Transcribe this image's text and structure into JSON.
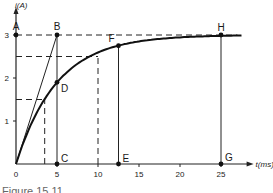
{
  "chart_data": {
    "type": "line",
    "title": "",
    "xlabel": "t(ms)",
    "ylabel": "i(A)",
    "xlim": [
      0,
      28
    ],
    "ylim": [
      0,
      3.4
    ],
    "x_ticks": [
      0,
      5,
      10,
      15,
      20,
      25
    ],
    "y_ticks": [
      1,
      2,
      3
    ],
    "grid": false,
    "series": [
      {
        "name": "current rise",
        "function": "i = 3*(1 - exp(-t/5))",
        "x": [
          0,
          1,
          2,
          3,
          4,
          5,
          6,
          7,
          8,
          10,
          12.5,
          15,
          17.5,
          20,
          22.5,
          25,
          27
        ],
        "y": [
          0,
          0.54,
          0.99,
          1.35,
          1.65,
          1.9,
          2.1,
          2.26,
          2.4,
          2.59,
          2.75,
          2.85,
          2.91,
          2.95,
          2.97,
          2.98,
          2.99
        ]
      }
    ],
    "tangent_line": {
      "from": [
        0,
        0
      ],
      "to": [
        5,
        3
      ]
    },
    "dashed_levels": [
      {
        "i": 3.0,
        "t_end": 27
      },
      {
        "i": 2.5,
        "t_end": 10
      },
      {
        "i": 1.5,
        "t_end": 3.5
      }
    ],
    "vertical_lines": [
      {
        "t": 5,
        "style": "solid",
        "i_top": 3
      },
      {
        "t": 12.5,
        "style": "solid",
        "i_top": 2.75
      },
      {
        "t": 25,
        "style": "solid",
        "i_top": 3
      },
      {
        "t": 10,
        "style": "dashed",
        "i_top": 2.5
      },
      {
        "t": 3.5,
        "style": "dashed",
        "i_top": 1.5
      }
    ],
    "points": [
      {
        "label": "A",
        "t": 0,
        "i": 3
      },
      {
        "label": "B",
        "t": 5,
        "i": 3
      },
      {
        "label": "C",
        "t": 5,
        "i": 0
      },
      {
        "label": "D",
        "t": 5,
        "i": 1.9
      },
      {
        "label": "E",
        "t": 12.5,
        "i": 0
      },
      {
        "label": "F",
        "t": 12.5,
        "i": 2.75
      },
      {
        "label": "G",
        "t": 25,
        "i": 0
      },
      {
        "label": "H",
        "t": 25,
        "i": 3
      }
    ]
  },
  "caption": "Figure 15.11"
}
